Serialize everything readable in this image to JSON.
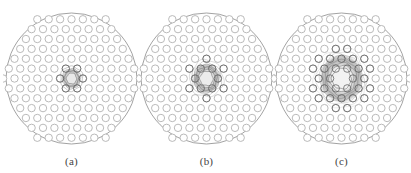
{
  "figure": {
    "background_color": "#ffffff",
    "width": 411,
    "height": 173,
    "panel_count": 3
  },
  "panels": [
    {
      "id": "panel-a",
      "caption": "(a)",
      "x": 3,
      "cladding_outline_color": "#8a8a8a",
      "hole_stroke_color": "#b2b2b2",
      "mode_spread": "tight",
      "mode_radius": 10,
      "contour_rings": 4,
      "core_bright_color": "#e8e8e8"
    },
    {
      "id": "panel-b",
      "caption": "(b)",
      "x": 138,
      "cladding_outline_color": "#8a8a8a",
      "hole_stroke_color": "#b2b2b2",
      "mode_spread": "medium",
      "mode_radius": 15,
      "contour_rings": 6,
      "core_bright_color": "#ececec"
    },
    {
      "id": "panel-c",
      "caption": "(c)",
      "x": 273,
      "cladding_outline_color": "#8a8a8a",
      "hole_stroke_color": "#b2b2b2",
      "mode_spread": "wide",
      "mode_radius": 24,
      "contour_rings": 8,
      "core_bright_color": "#f2f2f2"
    }
  ],
  "chart_data": {
    "type": "heatmap",
    "title": "",
    "subtitle": "",
    "xlabel": "",
    "ylabel": "",
    "shared": {
      "lattice": "hexagonal",
      "rings": 6,
      "pitch_px": 11.4,
      "hole_diameter_px": 7.4,
      "center_defect": true,
      "cladding_diameter_px": 131,
      "holes_across_center_row": 11,
      "top_row_holes": 6
    },
    "series": [
      {
        "name": "(a)",
        "panel": "panel-a",
        "mode_field_radius_px": 10,
        "contour_levels": [
          0.1,
          0.3,
          0.5,
          0.7,
          0.9
        ],
        "peak_intensity": 1.0,
        "confinement": "strongest"
      },
      {
        "name": "(b)",
        "panel": "panel-b",
        "mode_field_radius_px": 15,
        "contour_levels": [
          0.1,
          0.3,
          0.5,
          0.7,
          0.9
        ],
        "peak_intensity": 1.0,
        "confinement": "moderate"
      },
      {
        "name": "(c)",
        "panel": "panel-c",
        "mode_field_radius_px": 24,
        "contour_levels": [
          0.1,
          0.3,
          0.5,
          0.7,
          0.9
        ],
        "peak_intensity": 1.0,
        "confinement": "weakest"
      }
    ],
    "categories": [
      "(a)",
      "(b)",
      "(c)"
    ],
    "values": [
      10,
      15,
      24
    ],
    "legend": [],
    "grid": false
  }
}
